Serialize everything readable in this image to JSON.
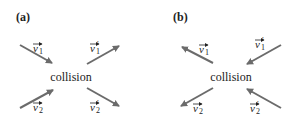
{
  "panels": [
    {
      "label": "(a)",
      "center_text": "collision",
      "vectors": [
        {
          "name": "v1",
          "label": "v",
          "sub": "1",
          "prime": "",
          "direction": "incoming"
        },
        {
          "name": "v1p",
          "label": "v",
          "sub": "1",
          "prime": "′",
          "direction": "outgoing"
        },
        {
          "name": "v2",
          "label": "v",
          "sub": "2",
          "prime": "",
          "direction": "incoming"
        },
        {
          "name": "v2p",
          "label": "v",
          "sub": "2",
          "prime": "′",
          "direction": "outgoing"
        }
      ]
    },
    {
      "label": "(b)",
      "center_text": "collision",
      "vectors": [
        {
          "name": "v1",
          "label": "v",
          "sub": "1",
          "prime": "",
          "direction": "outgoing"
        },
        {
          "name": "v1p",
          "label": "v",
          "sub": "1",
          "prime": "′",
          "direction": "incoming"
        },
        {
          "name": "v2",
          "label": "v",
          "sub": "2",
          "prime": "",
          "direction": "outgoing"
        },
        {
          "name": "v2p",
          "label": "v",
          "sub": "2",
          "prime": "′",
          "direction": "incoming"
        }
      ]
    }
  ],
  "colors": {
    "arrow": "#6b6b6b",
    "text": "#222222"
  }
}
